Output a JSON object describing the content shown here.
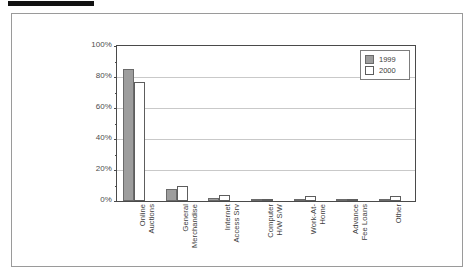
{
  "figure": {
    "redaction_bar": "",
    "background_color": "#ffffff",
    "frame_color": "#9a9a9a"
  },
  "legend": {
    "position": "top-right",
    "entries": [
      {
        "label": "1999",
        "color": "#9d9d9d"
      },
      {
        "label": "2000",
        "color": "#ffffff"
      }
    ]
  },
  "axis": {
    "y_ticks": [
      "0%",
      "20%",
      "40%",
      "60%",
      "80%",
      "100%"
    ],
    "y_tick_values": [
      0,
      20,
      40,
      60,
      80,
      100
    ]
  },
  "chart_data": {
    "type": "bar",
    "title": "",
    "subtitle": "",
    "xlabel": "",
    "ylabel": "",
    "ylim": [
      0,
      100
    ],
    "grid": true,
    "legend_position": "top-right",
    "categories": [
      "Online\nAuctions",
      "General\nMerchandise",
      "Internet\nAccess Srv",
      "Computer\nH/W S/W",
      "Work-At-\nHome",
      "Advance\nFee Loans",
      "Other"
    ],
    "series": [
      {
        "name": "1999",
        "color": "#9d9d9d",
        "values": [
          85,
          8,
          2,
          1,
          1.5,
          1,
          1.5
        ]
      },
      {
        "name": "2000",
        "color": "#ffffff",
        "values": [
          77,
          10,
          4,
          1,
          3,
          1,
          3
        ]
      }
    ],
    "ytick_labels": [
      "0%",
      "20%",
      "40%",
      "60%",
      "80%",
      "100%"
    ],
    "ytick_values": [
      0,
      20,
      40,
      60,
      80,
      100
    ]
  }
}
